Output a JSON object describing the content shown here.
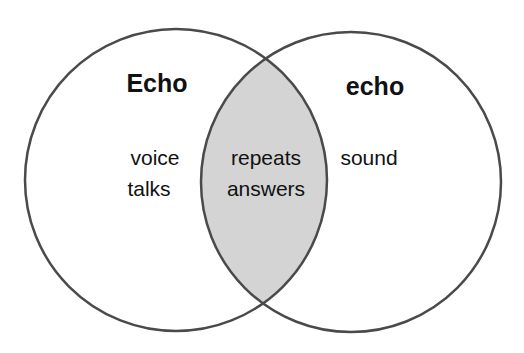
{
  "diagram": {
    "type": "venn",
    "left": {
      "title": "Echo",
      "items": [
        "voice",
        "talks"
      ]
    },
    "right": {
      "title": "echo",
      "items": [
        "sound"
      ]
    },
    "overlap": {
      "items": [
        "repeats",
        "answers"
      ]
    }
  },
  "colors": {
    "stroke": "#4a4a4a",
    "overlap_fill": "#d4d4d4",
    "background": "#ffffff"
  }
}
